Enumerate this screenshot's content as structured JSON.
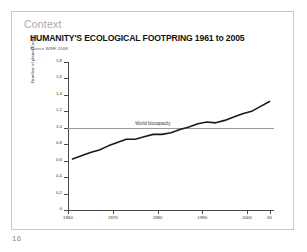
{
  "slide": {
    "section_label": "Context",
    "page_number": "16"
  },
  "chart_data": {
    "type": "line",
    "title": "HUMANITY'S ECOLOGICAL FOOTPRING 1961 to 2005",
    "subtitle": "Source WWF 2008",
    "xlabel": "",
    "ylabel": "Number of planet Earths",
    "xlim": [
      1960,
      2006
    ],
    "ylim": [
      0,
      1.8
    ],
    "grid": false,
    "legend_position": "none",
    "x_ticks": [
      1960,
      1970,
      1980,
      1990,
      2000,
      2005
    ],
    "x_tick_labels": [
      "1960",
      "1970",
      "1980",
      "1990",
      "2000",
      "05"
    ],
    "y_ticks": [
      0,
      0.2,
      0.4,
      0.6,
      0.8,
      1.0,
      1.2,
      1.4,
      1.6,
      1.8
    ],
    "y_tick_labels": [
      "0",
      "0,2",
      "0,4",
      "0,6",
      "0,8",
      "1,0",
      "1,2",
      "1,4",
      "1,6",
      "1,8"
    ],
    "annotations": [
      {
        "name": "world-biocapacity",
        "label": "World biocapacity",
        "type": "hline",
        "y": 1.0,
        "color": "#9a9a9a"
      }
    ],
    "series": [
      {
        "name": "Ecological footprint",
        "color": "#1a1a1a",
        "x": [
          1961,
          1963,
          1965,
          1967,
          1969,
          1971,
          1973,
          1975,
          1977,
          1979,
          1981,
          1983,
          1985,
          1987,
          1989,
          1991,
          1993,
          1995,
          1997,
          1999,
          2001,
          2003,
          2005
        ],
        "values": [
          0.62,
          0.66,
          0.7,
          0.73,
          0.78,
          0.82,
          0.86,
          0.86,
          0.89,
          0.92,
          0.92,
          0.94,
          0.98,
          1.01,
          1.05,
          1.07,
          1.06,
          1.09,
          1.13,
          1.17,
          1.2,
          1.26,
          1.32
        ]
      }
    ]
  },
  "colors": {
    "accent_line": "#1a1a1a",
    "biocapacity_line": "#9a9a9a",
    "axis": "#4a4a4a",
    "section_label": "#a8a8a8"
  }
}
